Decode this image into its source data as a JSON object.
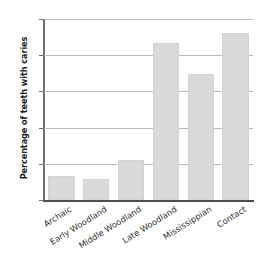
{
  "chart_data": {
    "type": "bar",
    "title": "",
    "xlabel": "",
    "ylabel": "Percentage of teeth with caries",
    "categories": [
      "Archaic",
      "Early Woodland",
      "Middle Woodland",
      "Late Woodland",
      "Mississippian",
      "Contact"
    ],
    "values": [
      3.3,
      2.9,
      5.5,
      21.7,
      17.4,
      23.0
    ],
    "ylim": [
      0,
      25
    ],
    "yticks": [
      0,
      5,
      10,
      15,
      20,
      25
    ],
    "ytick_labels": [
      "0",
      "5",
      "10",
      "15",
      "20",
      "25"
    ],
    "grid": true,
    "legend": "none",
    "bar_color": "#d9d9d9",
    "axis_color": "#4d4d4d",
    "grid_color": "#b9b9b9",
    "text_color": "#2b2b2b"
  }
}
